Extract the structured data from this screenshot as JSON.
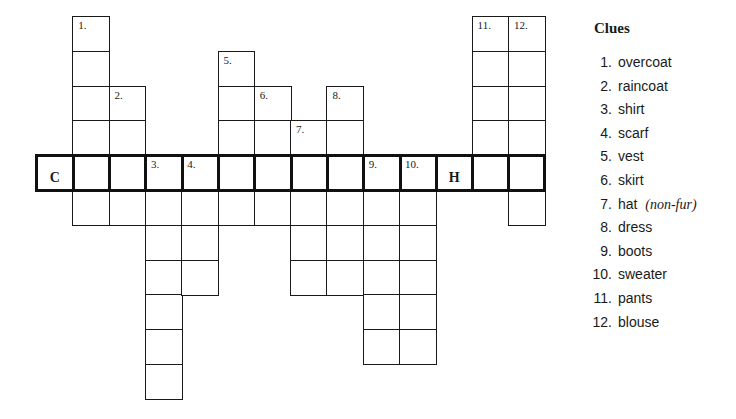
{
  "puzzle": {
    "cell_w": 36.3,
    "cell_h": 34.8,
    "origin_x": 36,
    "origin_y": 16,
    "main_row": 4,
    "main_row_cols": [
      0,
      13
    ],
    "columns": [
      {
        "col": 0,
        "rows": [
          4,
          4
        ],
        "number": "",
        "letter": "C"
      },
      {
        "col": 1,
        "rows": [
          0,
          5
        ],
        "number": "1."
      },
      {
        "col": 2,
        "rows": [
          2,
          5
        ],
        "number": "2."
      },
      {
        "col": 3,
        "rows": [
          4,
          10
        ],
        "number": "3."
      },
      {
        "col": 4,
        "rows": [
          4,
          7
        ],
        "number": "4."
      },
      {
        "col": 5,
        "rows": [
          1,
          5
        ],
        "number": "5."
      },
      {
        "col": 6,
        "rows": [
          2,
          5
        ],
        "number": "6."
      },
      {
        "col": 7,
        "rows": [
          3,
          7
        ],
        "number": "7."
      },
      {
        "col": 8,
        "rows": [
          2,
          7
        ],
        "number": "8."
      },
      {
        "col": 9,
        "rows": [
          4,
          9
        ],
        "number": "9."
      },
      {
        "col": 10,
        "rows": [
          4,
          9
        ],
        "number": "10."
      },
      {
        "col": 11,
        "rows": [
          4,
          4
        ],
        "number": "",
        "letter": "H"
      },
      {
        "col": 12,
        "rows": [
          0,
          4
        ],
        "number": "11."
      },
      {
        "col": 13,
        "rows": [
          0,
          5
        ],
        "number": "12."
      }
    ]
  },
  "clues": {
    "title": "Clues",
    "items": [
      {
        "n": "1.",
        "text": "overcoat"
      },
      {
        "n": "2.",
        "text": "raincoat"
      },
      {
        "n": "3.",
        "text": "shirt"
      },
      {
        "n": "4.",
        "text": "scarf"
      },
      {
        "n": "5.",
        "text": "vest"
      },
      {
        "n": "6.",
        "text": "skirt"
      },
      {
        "n": "7.",
        "text": "hat",
        "note": "(non-fur)"
      },
      {
        "n": "8.",
        "text": "dress"
      },
      {
        "n": "9.",
        "text": "boots"
      },
      {
        "n": "10.",
        "text": "sweater"
      },
      {
        "n": "11.",
        "text": "pants"
      },
      {
        "n": "12.",
        "text": "blouse"
      }
    ]
  }
}
